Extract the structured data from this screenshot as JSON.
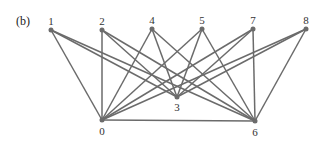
{
  "panel_label": "(b)",
  "style": {
    "edge_color": "#6b6b6b",
    "node_color": "#6b6b6b",
    "label_color": "#333333"
  },
  "nodes": [
    {
      "id": "1",
      "label": "1",
      "x": 51,
      "y": 30,
      "lx": 51,
      "ly": 16
    },
    {
      "id": "2",
      "label": "2",
      "x": 102,
      "y": 30,
      "lx": 102,
      "ly": 16
    },
    {
      "id": "4",
      "label": "4",
      "x": 152,
      "y": 29,
      "lx": 152,
      "ly": 15
    },
    {
      "id": "5",
      "label": "5",
      "x": 202,
      "y": 29,
      "lx": 202,
      "ly": 15
    },
    {
      "id": "7",
      "label": "7",
      "x": 253,
      "y": 29,
      "lx": 253,
      "ly": 15
    },
    {
      "id": "8",
      "label": "8",
      "x": 306,
      "y": 29,
      "lx": 306,
      "ly": 15
    },
    {
      "id": "3",
      "label": "3",
      "x": 177,
      "y": 97,
      "lx": 177,
      "ly": 102
    },
    {
      "id": "0",
      "label": "0",
      "x": 102,
      "y": 120,
      "lx": 102,
      "ly": 126
    },
    {
      "id": "6",
      "label": "6",
      "x": 255,
      "y": 121,
      "lx": 255,
      "ly": 127
    }
  ],
  "edges": [
    [
      "1",
      "0"
    ],
    [
      "1",
      "3"
    ],
    [
      "1",
      "6"
    ],
    [
      "2",
      "0"
    ],
    [
      "2",
      "3"
    ],
    [
      "2",
      "6"
    ],
    [
      "4",
      "0"
    ],
    [
      "4",
      "3"
    ],
    [
      "4",
      "6"
    ],
    [
      "5",
      "0"
    ],
    [
      "5",
      "3"
    ],
    [
      "5",
      "6"
    ],
    [
      "7",
      "0"
    ],
    [
      "7",
      "3"
    ],
    [
      "7",
      "6"
    ],
    [
      "8",
      "0"
    ],
    [
      "8",
      "3"
    ],
    [
      "8",
      "6"
    ],
    [
      "0",
      "6"
    ]
  ]
}
